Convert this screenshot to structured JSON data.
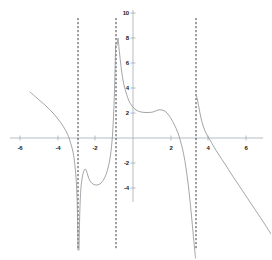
{
  "chart_data": {
    "type": "line",
    "title": "",
    "xlabel": "",
    "ylabel": "",
    "xlim": [
      -7.0,
      7.0
    ],
    "ylim": [
      -6.2,
      10.6
    ],
    "grid": false,
    "legend": null,
    "axis_color": "#9aa0a6",
    "curve_color": "#8a8f94",
    "asymptote_color": "#2b2b2b",
    "x_ticks": [
      {
        "value": -6,
        "label": "-6",
        "px": 20
      },
      {
        "value": -4,
        "label": "-4",
        "px": 58
      },
      {
        "value": -2,
        "label": "-2",
        "px": 95
      },
      {
        "value": 2,
        "label": "2",
        "px": 171
      },
      {
        "value": 4,
        "label": "4",
        "px": 208
      },
      {
        "value": 6,
        "label": "6",
        "px": 246
      }
    ],
    "y_ticks": [
      {
        "value": 10,
        "label": "10",
        "py": 13
      },
      {
        "value": 8,
        "label": "8",
        "py": 38
      },
      {
        "value": 6,
        "label": "6",
        "py": 63
      },
      {
        "value": 4,
        "label": "4",
        "py": 88
      },
      {
        "value": 2,
        "label": "2",
        "py": 113
      },
      {
        "value": -2,
        "label": "-2",
        "py": 163
      },
      {
        "value": -4,
        "label": "-4",
        "py": 188
      }
    ],
    "origin_px": {
      "x": 133,
      "y": 138
    },
    "scale_px_per_unit": {
      "x": 18.9,
      "y": 12.5
    },
    "asymptotes": [
      {
        "x": -2.9,
        "px": 78,
        "style": "dashed"
      },
      {
        "x": -0.9,
        "px": 116,
        "style": "dashed"
      },
      {
        "x": 3.3,
        "px": 196,
        "style": "dashed"
      }
    ],
    "branches": [
      {
        "name": "branch-left",
        "x_range": [
          -5.4,
          -2.9
        ],
        "points_px": [
          [
            30,
            92
          ],
          [
            38,
            99
          ],
          [
            46,
            106
          ],
          [
            53,
            113
          ],
          [
            58,
            119
          ],
          [
            63,
            126
          ],
          [
            67,
            133
          ],
          [
            70,
            141
          ],
          [
            73,
            152
          ],
          [
            75,
            166
          ],
          [
            76.5,
            185
          ],
          [
            77.4,
            210
          ],
          [
            77.8,
            232
          ],
          [
            78,
            250
          ]
        ]
      },
      {
        "name": "branch-middle-left",
        "x_range": [
          -2.9,
          -0.9
        ],
        "points_px": [
          [
            79,
            250
          ],
          [
            79.4,
            228
          ],
          [
            80,
            206
          ],
          [
            80.8,
            190
          ],
          [
            82,
            179
          ],
          [
            83.5,
            172
          ],
          [
            85,
            169
          ],
          [
            86.5,
            171
          ],
          [
            88,
            176
          ],
          [
            90,
            181
          ],
          [
            93,
            184
          ],
          [
            97,
            185
          ],
          [
            101,
            183
          ],
          [
            105,
            177
          ],
          [
            108,
            168
          ],
          [
            110.5,
            155
          ],
          [
            112.5,
            135
          ],
          [
            114,
            105
          ],
          [
            115,
            72
          ],
          [
            115.6,
            45
          ]
        ]
      },
      {
        "name": "branch-middle-right",
        "x_range": [
          -0.9,
          3.3
        ],
        "points_px": [
          [
            117.2,
            45
          ],
          [
            118,
            38
          ],
          [
            119,
            48
          ],
          [
            120.5,
            62
          ],
          [
            122,
            74
          ],
          [
            124,
            85
          ],
          [
            126.5,
            94
          ],
          [
            129,
            101
          ],
          [
            132,
            106
          ],
          [
            136,
            110
          ],
          [
            141,
            112
          ],
          [
            147,
            112.5
          ],
          [
            153,
            112
          ],
          [
            158,
            110
          ],
          [
            162,
            110
          ],
          [
            166,
            112
          ],
          [
            170,
            117
          ],
          [
            174,
            124
          ],
          [
            178,
            133
          ],
          [
            181,
            143
          ],
          [
            184,
            156
          ],
          [
            187,
            175
          ],
          [
            189.5,
            196
          ],
          [
            191.5,
            216
          ],
          [
            193,
            232
          ],
          [
            194.5,
            248
          ],
          [
            195.5,
            258
          ]
        ]
      },
      {
        "name": "branch-right",
        "x_range": [
          3.3,
          7.0
        ],
        "points_px": [
          [
            196.5,
            96
          ],
          [
            197.5,
            100
          ],
          [
            199,
            108
          ],
          [
            201,
            118
          ],
          [
            203.5,
            127
          ],
          [
            206.5,
            134
          ],
          [
            210,
            140
          ],
          [
            214,
            147
          ],
          [
            219,
            155
          ],
          [
            225,
            164
          ],
          [
            232,
            175
          ],
          [
            240,
            187
          ],
          [
            248,
            199
          ],
          [
            256,
            211
          ],
          [
            264,
            223
          ],
          [
            271,
            234
          ]
        ]
      }
    ]
  }
}
